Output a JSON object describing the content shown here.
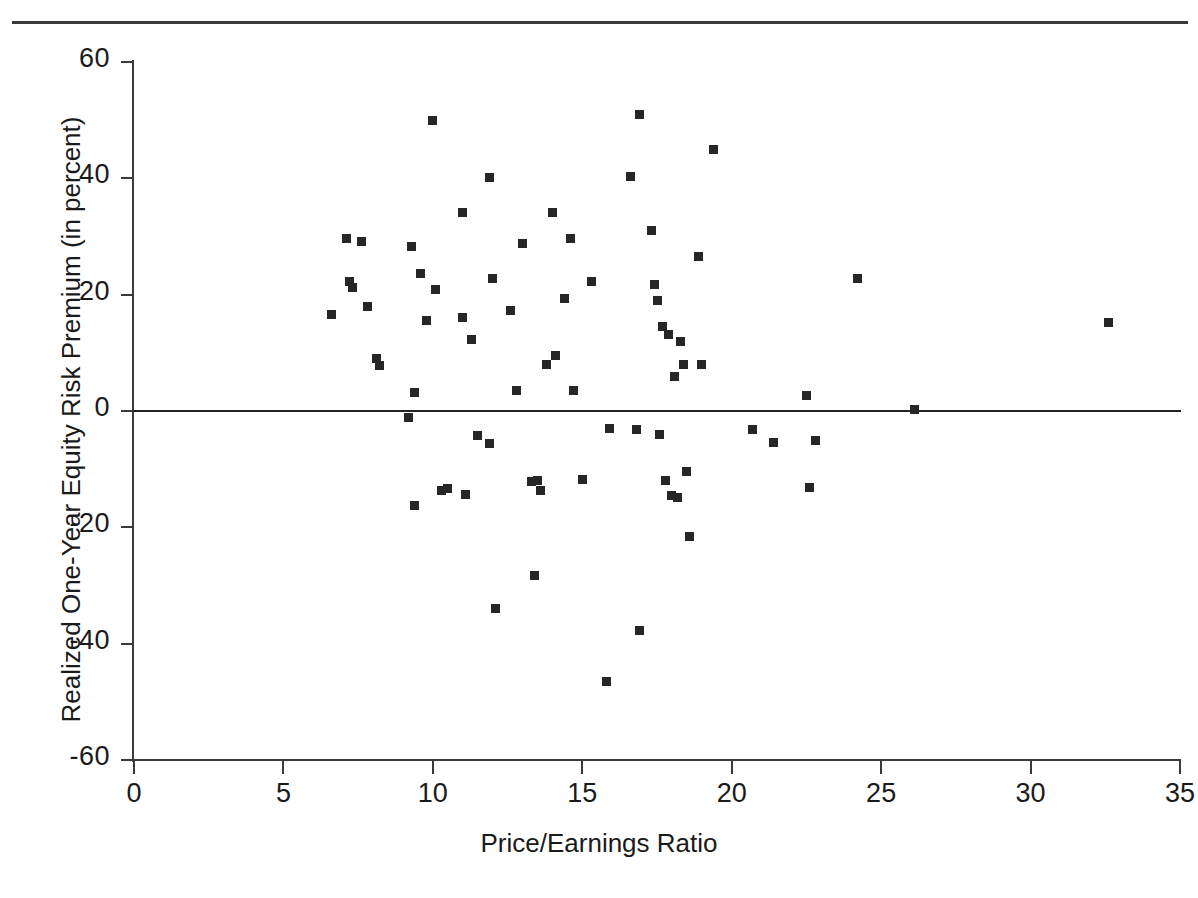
{
  "chart_data": {
    "type": "scatter",
    "title": "",
    "xlabel": "Price/Earnings Ratio",
    "ylabel": "Realized One-Year Equity Risk Premium (in percent)",
    "xlim": [
      0,
      35
    ],
    "ylim": [
      -60,
      60
    ],
    "xticks": [
      0,
      5,
      10,
      15,
      20,
      25,
      30,
      35
    ],
    "yticks": [
      -60,
      -40,
      -20,
      0,
      20,
      40,
      60
    ],
    "xtick_labels": [
      "0",
      "5",
      "10",
      "15",
      "20",
      "25",
      "30",
      "35"
    ],
    "ytick_labels": [
      "-60",
      "-40",
      "-20",
      "0",
      "20",
      "40",
      "60"
    ],
    "grid": false,
    "legend": null,
    "reference_lines": [
      {
        "name": "zero-line",
        "axis": "y",
        "value": 0
      }
    ],
    "marker": {
      "shape": "square",
      "color": "#262626",
      "size_px": 9
    },
    "points": [
      {
        "x": 6.6,
        "y": 16.6
      },
      {
        "x": 7.1,
        "y": 29.6
      },
      {
        "x": 7.2,
        "y": 22.2
      },
      {
        "x": 7.3,
        "y": 21.3
      },
      {
        "x": 7.6,
        "y": 29.2
      },
      {
        "x": 7.8,
        "y": 18.0
      },
      {
        "x": 8.1,
        "y": 9.0
      },
      {
        "x": 8.2,
        "y": 7.8
      },
      {
        "x": 9.2,
        "y": -1.2
      },
      {
        "x": 9.3,
        "y": 28.2
      },
      {
        "x": 9.4,
        "y": 3.1
      },
      {
        "x": 9.4,
        "y": -16.3
      },
      {
        "x": 9.6,
        "y": 23.6
      },
      {
        "x": 9.8,
        "y": 15.6
      },
      {
        "x": 10.0,
        "y": 50.0
      },
      {
        "x": 10.1,
        "y": 20.9
      },
      {
        "x": 10.3,
        "y": -13.6
      },
      {
        "x": 10.5,
        "y": -13.4
      },
      {
        "x": 11.0,
        "y": 34.2
      },
      {
        "x": 11.0,
        "y": 16.0
      },
      {
        "x": 11.1,
        "y": -14.4
      },
      {
        "x": 11.3,
        "y": 12.3
      },
      {
        "x": 11.5,
        "y": -4.2
      },
      {
        "x": 11.9,
        "y": 40.1
      },
      {
        "x": 11.9,
        "y": -5.6
      },
      {
        "x": 12.0,
        "y": 22.8
      },
      {
        "x": 12.1,
        "y": -33.9
      },
      {
        "x": 12.6,
        "y": 17.2
      },
      {
        "x": 12.8,
        "y": 3.5
      },
      {
        "x": 13.0,
        "y": 28.8
      },
      {
        "x": 13.3,
        "y": -12.1
      },
      {
        "x": 13.4,
        "y": -28.2
      },
      {
        "x": 13.5,
        "y": -12.0
      },
      {
        "x": 13.6,
        "y": -13.6
      },
      {
        "x": 13.8,
        "y": 8.0
      },
      {
        "x": 14.0,
        "y": 34.1
      },
      {
        "x": 14.1,
        "y": 9.5
      },
      {
        "x": 14.4,
        "y": 19.4
      },
      {
        "x": 14.6,
        "y": 29.6
      },
      {
        "x": 14.7,
        "y": 3.6
      },
      {
        "x": 15.0,
        "y": -11.7
      },
      {
        "x": 15.3,
        "y": 22.2
      },
      {
        "x": 15.8,
        "y": -46.5
      },
      {
        "x": 15.9,
        "y": -3.0
      },
      {
        "x": 16.6,
        "y": 40.4
      },
      {
        "x": 16.8,
        "y": -3.1
      },
      {
        "x": 16.9,
        "y": 51.0
      },
      {
        "x": 16.9,
        "y": -37.8
      },
      {
        "x": 17.3,
        "y": 31.1
      },
      {
        "x": 17.4,
        "y": 21.8
      },
      {
        "x": 17.5,
        "y": 19.0
      },
      {
        "x": 17.6,
        "y": -4.1
      },
      {
        "x": 17.7,
        "y": 14.6
      },
      {
        "x": 17.8,
        "y": -12.0
      },
      {
        "x": 17.9,
        "y": 13.2
      },
      {
        "x": 18.0,
        "y": -14.6
      },
      {
        "x": 18.1,
        "y": 5.9
      },
      {
        "x": 18.2,
        "y": -14.8
      },
      {
        "x": 18.3,
        "y": 12.0
      },
      {
        "x": 18.4,
        "y": 8.0
      },
      {
        "x": 18.5,
        "y": -10.4
      },
      {
        "x": 18.6,
        "y": -21.6
      },
      {
        "x": 18.9,
        "y": 26.6
      },
      {
        "x": 19.0,
        "y": 8.0
      },
      {
        "x": 19.4,
        "y": 44.9
      },
      {
        "x": 20.7,
        "y": -3.2
      },
      {
        "x": 21.4,
        "y": -5.5
      },
      {
        "x": 22.5,
        "y": 2.7
      },
      {
        "x": 22.6,
        "y": -13.1
      },
      {
        "x": 22.8,
        "y": -5.0
      },
      {
        "x": 24.2,
        "y": 22.7
      },
      {
        "x": 26.1,
        "y": 0.3
      },
      {
        "x": 32.6,
        "y": 15.2
      }
    ]
  },
  "axis": {
    "x_title": "Price/Earnings Ratio",
    "y_title": "Realized One-Year Equity Risk Premium (in percent)"
  },
  "colors": {
    "marker": "#262626",
    "axis": "#3a3a3a",
    "background": "#ffffff"
  }
}
